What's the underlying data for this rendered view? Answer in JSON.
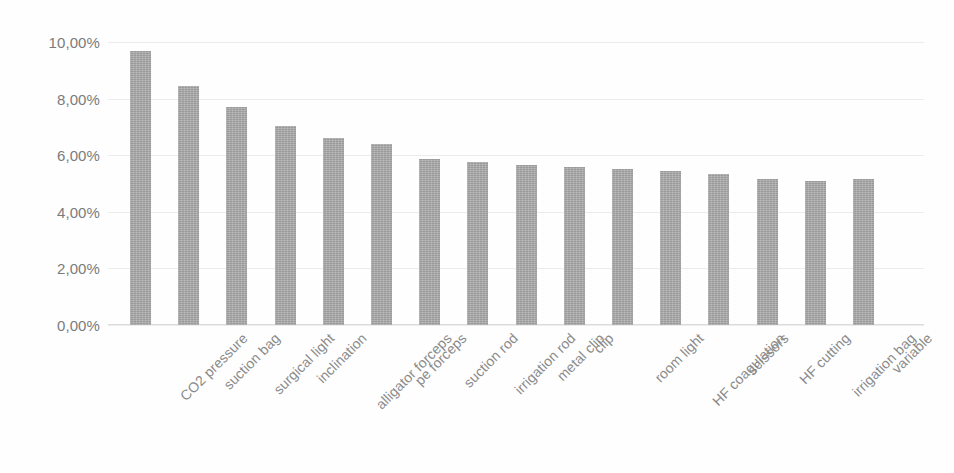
{
  "chart_data": {
    "type": "bar",
    "title": "",
    "subtitle": "",
    "xlabel": "",
    "ylabel": "",
    "ylim": [
      0,
      10
    ],
    "y_tick_values": [
      10,
      8,
      6,
      4,
      2,
      0
    ],
    "y_tick_labels": [
      "10,00%",
      "8,00%",
      "6,00%",
      "4,00%",
      "2,00%",
      "0,00%"
    ],
    "value_format": "percent",
    "decimal_separator": ",",
    "grid": "horizontal",
    "legend": "none",
    "orientation": "vertical",
    "bar_color": "#a8a8a8",
    "background_color": "#fefefe",
    "gridline_color": "#ececec",
    "axis_label_color": "#8a8a8a",
    "categories": [
      "CO2 pressure",
      "suction bag",
      "surgical light",
      "inclination",
      "alligator forceps",
      "pe forceps",
      "suction rod",
      "irrigation rod",
      "metal clip",
      "clip",
      "room light",
      "HF coagulation",
      "scissors",
      "HF cutting",
      "irrigation bag",
      "variable"
    ],
    "values": [
      9.7,
      8.45,
      7.7,
      7.05,
      6.6,
      6.4,
      5.85,
      5.75,
      5.65,
      5.6,
      5.5,
      5.45,
      5.35,
      5.15,
      5.1,
      5.15
    ],
    "value_labels": [
      "9,70%",
      "8,45%",
      "7,70%",
      "7,05%",
      "6,60%",
      "6,40%",
      "5,85%",
      "5,75%",
      "5,65%",
      "5,60%",
      "5,50%",
      "5,45%",
      "5,35%",
      "5,15%",
      "5,10%",
      "5,15%"
    ],
    "series": [
      {
        "name": "",
        "values": [
          9.7,
          8.45,
          7.7,
          7.05,
          6.6,
          6.4,
          5.85,
          5.75,
          5.65,
          5.6,
          5.5,
          5.45,
          5.35,
          5.15,
          5.1,
          5.15
        ]
      }
    ]
  }
}
